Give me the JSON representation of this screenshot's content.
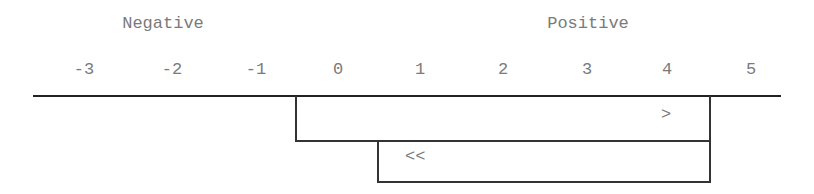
{
  "headers": {
    "negative": "Negative",
    "positive": "Positive"
  },
  "ticks": [
    "-3",
    "-2",
    "-1",
    "0",
    "1",
    "2",
    "3",
    "4",
    "5"
  ],
  "intervals": [
    {
      "from": "-0.5",
      "to": "4.5",
      "symbol": ">"
    },
    {
      "from": "0.5",
      "to": "4.5",
      "symbol": "<<"
    }
  ],
  "colors": {
    "line": "#222222",
    "text": "#7a7a7a"
  }
}
